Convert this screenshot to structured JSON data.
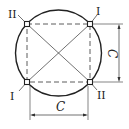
{
  "diagram": {
    "corner_labels": {
      "top_left": "II",
      "top_right": "I",
      "bottom_left": "I",
      "bottom_right": "II"
    },
    "dimensions": {
      "horizontal": "C",
      "vertical": "C"
    },
    "colors": {
      "line": "#222222",
      "background": "#ffffff"
    }
  }
}
